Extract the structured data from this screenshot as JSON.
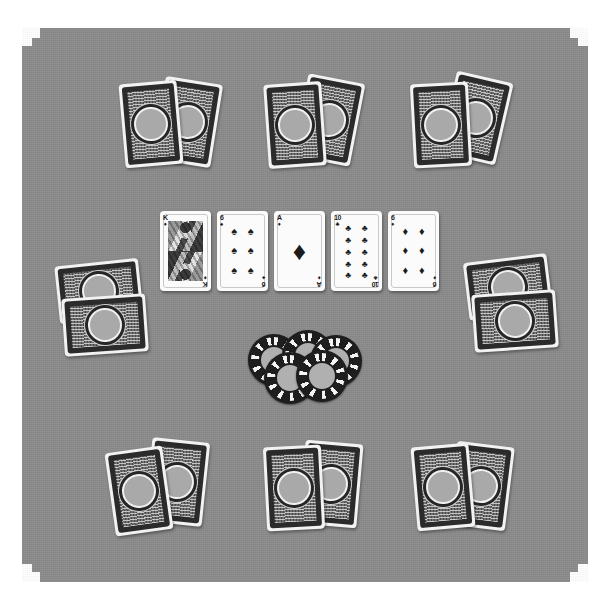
{
  "scene": {
    "title": "Poker Table",
    "background_color": "#ffffff",
    "felt_color": "#8b8b8b",
    "corner_pocket_count": 4,
    "grayscale": true
  },
  "board": {
    "label": "Community Cards",
    "stage": "River",
    "cards": [
      {
        "rank": "K",
        "suit_name": "diamonds",
        "suit_glyph": "♦",
        "pip_count": 0,
        "is_face": true,
        "color": "#1b1b1b",
        "label": "King of Diamonds"
      },
      {
        "rank": "6",
        "suit_name": "spades",
        "suit_glyph": "♠",
        "pip_count": 6,
        "is_face": false,
        "color": "#1b1b1b",
        "label": "Six of Spades"
      },
      {
        "rank": "A",
        "suit_name": "diamonds",
        "suit_glyph": "♦",
        "pip_count": 1,
        "is_face": false,
        "color": "#1b1b1b",
        "label": "Ace of Diamonds"
      },
      {
        "rank": "10",
        "suit_name": "clubs",
        "suit_glyph": "♣",
        "pip_count": 10,
        "is_face": false,
        "color": "#1b1b1b",
        "label": "Ten of Clubs"
      },
      {
        "rank": "6",
        "suit_name": "diamonds",
        "suit_glyph": "♦",
        "pip_count": 6,
        "is_face": false,
        "color": "#1b1b1b",
        "label": "Six of Diamonds"
      }
    ]
  },
  "pot": {
    "label": "Pot",
    "chip_count": 5,
    "chip_body_color": "#1e1e1e",
    "chip_edge_color": "#f4f4f4",
    "chip_center_color": "#b0b0b0"
  },
  "seats": [
    {
      "id": "seat-top-left",
      "position_label": "Top Left",
      "hole_cards": 2,
      "orientation": "portrait"
    },
    {
      "id": "seat-top-center",
      "position_label": "Top Center",
      "hole_cards": 2,
      "orientation": "portrait"
    },
    {
      "id": "seat-top-right",
      "position_label": "Top Right",
      "hole_cards": 2,
      "orientation": "portrait"
    },
    {
      "id": "seat-left",
      "position_label": "Left",
      "hole_cards": 2,
      "orientation": "landscape"
    },
    {
      "id": "seat-right",
      "position_label": "Right",
      "hole_cards": 2,
      "orientation": "landscape"
    },
    {
      "id": "seat-bottom-left",
      "position_label": "Bottom Left",
      "hole_cards": 2,
      "orientation": "portrait"
    },
    {
      "id": "seat-bottom-center",
      "position_label": "Bottom Center",
      "hole_cards": 2,
      "orientation": "portrait"
    },
    {
      "id": "seat-bottom-right",
      "position_label": "Bottom Right",
      "hole_cards": 2,
      "orientation": "portrait"
    }
  ],
  "card_back": {
    "label": "Card Back",
    "border_color": "#2b2b2b",
    "weave_color": "#6f6f6f",
    "medallion_color": "#a9a9a9"
  }
}
